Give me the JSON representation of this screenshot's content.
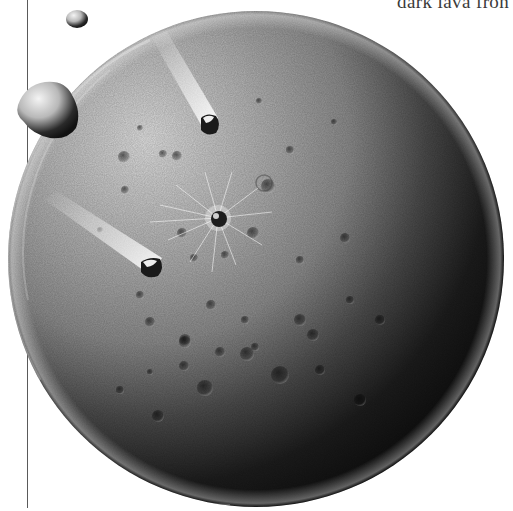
{
  "page": {
    "caption_fragment": "dark lava fron"
  },
  "illustration": {
    "subject": "cratered planet under meteor bombardment",
    "planet": {
      "cx": 256,
      "cy": 259,
      "r": 248,
      "light_color": "#d8d8d8",
      "mid_color": "#8c8c8c",
      "shadow_color": "#0e0e0e"
    },
    "central_crater": {
      "cx": 218,
      "cy": 218,
      "r": 8
    },
    "meteors": [
      {
        "name": "meteor-upper",
        "x": 209,
        "y": 123,
        "trail_from": [
          150,
          35
        ]
      },
      {
        "name": "meteor-lower",
        "x": 152,
        "y": 267,
        "trail_from": [
          45,
          205
        ]
      }
    ],
    "floating_rocks": [
      {
        "name": "small-rock",
        "cx": 77,
        "cy": 19,
        "r": 10
      },
      {
        "name": "large-rock",
        "cx": 48,
        "cy": 112,
        "r": 30
      }
    ],
    "colors": {
      "background": "#ffffff",
      "caption_text": "#3a3a3a",
      "margin_rule": "#5a5a5a"
    }
  }
}
